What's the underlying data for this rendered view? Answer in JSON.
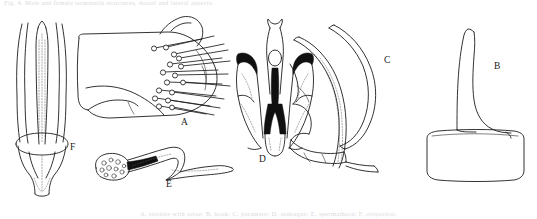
{
  "plate": {
    "kind": "scientific-line-drawing-plate",
    "background_color": "#ffffff",
    "ink_color": "#1c1c1c",
    "fill_color": "#101010",
    "caption_top": "Fig. 4.  Male and female terminalia structures, dorsal and lateral aspects.",
    "caption_bottom": "A, sternite with setae; B, hook; C, paramere; D, aedeagus; E, spermatheca; F, ovipositor.",
    "figures": [
      {
        "id": "F",
        "label": "F",
        "name": "elongate-ovipositor-figure",
        "description": "Elongate parallel-sided shaft with inner stylet and rounded basal collar"
      },
      {
        "id": "A",
        "label": "A",
        "name": "setose-plate-figure",
        "description": "Broad membranous plate bearing a marginal row of long stout setae"
      },
      {
        "id": "D",
        "label": "D",
        "name": "aedeagus-figure",
        "description": "Bilaterally symmetric genitalic capsule with black sclerotised lateral hooks"
      },
      {
        "id": "C",
        "label": "C",
        "name": "paramere-figure",
        "description": "Slender arcuate paired rods curving over a lobed basal piece"
      },
      {
        "id": "B",
        "label": "B",
        "name": "hook-on-base-figure",
        "description": "Tapering curved spine arising from a rounded rectangular basal plate"
      },
      {
        "id": "E",
        "label": "E",
        "name": "spermatheca-figure",
        "description": "Sigmoid duct with granulate swollen capsule at one end"
      }
    ]
  }
}
